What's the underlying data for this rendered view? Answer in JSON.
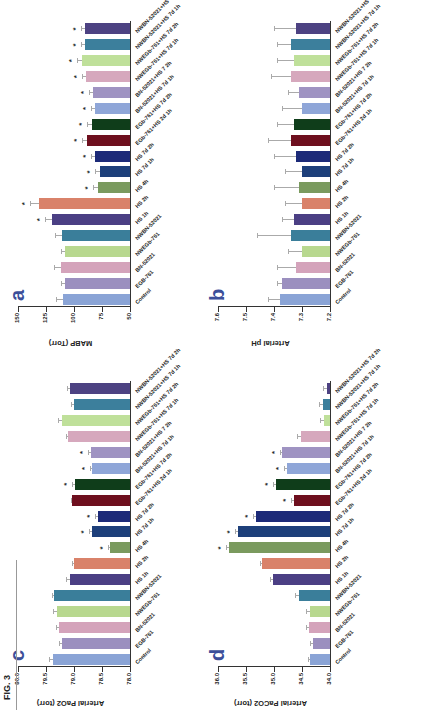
{
  "figure": {
    "label": "FIG. 3"
  },
  "categories": [
    "Control",
    "EGB-761",
    "BN-52021",
    "NWEGb-761",
    "NWBN-52021",
    "HS 1h",
    "HS 2h",
    "HS 4h",
    "HS 7d 1h",
    "HS 7d 2h",
    "EGb-761+HS 2d 1h",
    "EGb-761+HS 7d 2h",
    "BN-52021+HS 7d 1h",
    "BN-52021+HS 7 2h",
    "NWEGb-761+HS 7d 1h",
    "NWEGb-761+HS 7d 2h",
    "NWBN-52021+HS 7d 1h",
    "NWBN-52021+HS 7d 2h"
  ],
  "colors": [
    "#8aa4d6",
    "#9b8fbf",
    "#d4a3bb",
    "#b8d88f",
    "#3a7e9a",
    "#4b3f84",
    "#d9826a",
    "#7a9a5e",
    "#1d3f7a",
    "#1c2a78",
    "#6e0f1e",
    "#0f3d1a",
    "#8fa6d8",
    "#9f93c2",
    "#d6a8bd",
    "#bfe09a",
    "#3c7f9c",
    "#4d4282"
  ],
  "chart_data": [
    {
      "panel": "a",
      "type": "bar",
      "title": "",
      "ylabel": "MABP (Torr)",
      "xlabel": "",
      "ylim": [
        50,
        150
      ],
      "yticks": [
        "150",
        "125",
        "100",
        "75",
        "50"
      ],
      "values": [
        110,
        108,
        112,
        108,
        111,
        120,
        131,
        79,
        77,
        81,
        88,
        84,
        81,
        83,
        89,
        93,
        90,
        90
      ],
      "errors": [
        6,
        4,
        6,
        4,
        6,
        6,
        8,
        4,
        4,
        4,
        5,
        4,
        4,
        4,
        4,
        4,
        4,
        4
      ],
      "significant": [
        false,
        false,
        false,
        false,
        false,
        true,
        true,
        true,
        true,
        true,
        true,
        true,
        true,
        true,
        true,
        true,
        true,
        true
      ]
    },
    {
      "panel": "b",
      "type": "bar",
      "title": "",
      "ylabel": "Arterial pH",
      "xlabel": "",
      "ylim": [
        7.2,
        7.6
      ],
      "yticks": [
        "7.6",
        "7.5",
        "7.4",
        "7.3",
        "7.2"
      ],
      "values": [
        7.38,
        7.37,
        7.32,
        7.3,
        7.34,
        7.33,
        7.3,
        7.31,
        7.3,
        7.32,
        7.34,
        7.33,
        7.3,
        7.31,
        7.34,
        7.33,
        7.34,
        7.32
      ],
      "errors": [
        0.04,
        0.02,
        0.07,
        0.05,
        0.12,
        0.04,
        0.06,
        0.09,
        0.06,
        0.08,
        0.08,
        0.06,
        0.07,
        0.04,
        0.07,
        0.06,
        0.05,
        0.08
      ],
      "significant": [
        false,
        false,
        false,
        false,
        false,
        false,
        false,
        false,
        false,
        false,
        false,
        false,
        false,
        false,
        false,
        false,
        false,
        false
      ]
    },
    {
      "panel": "c",
      "type": "bar",
      "title": "",
      "ylabel": "Arterial PaO2 (torr)",
      "xlabel": "",
      "ylim": [
        78.0,
        80.0
      ],
      "yticks": [
        "80.0",
        "79.5",
        "79.0",
        "78.5",
        "78.0"
      ],
      "values": [
        79.37,
        79.22,
        79.27,
        79.3,
        79.35,
        79.07,
        79.0,
        78.35,
        78.67,
        78.57,
        79.03,
        78.98,
        78.67,
        78.7,
        79.1,
        79.22,
        79.0,
        79.07
      ],
      "errors": [
        0.07,
        0.05,
        0.05,
        0.07,
        0.05,
        0.07,
        0.03,
        0.05,
        0.07,
        0.05,
        0.03,
        0.05,
        0.05,
        0.05,
        0.05,
        0.07,
        0.05,
        0.05
      ],
      "significant": [
        false,
        false,
        false,
        false,
        false,
        false,
        false,
        true,
        true,
        true,
        false,
        true,
        true,
        true,
        false,
        false,
        false,
        false
      ]
    },
    {
      "panel": "d",
      "type": "bar",
      "title": "",
      "ylabel": "Arterial PaCO2 (torr)",
      "xlabel": "",
      "ylim": [
        34.0,
        36.0
      ],
      "yticks": [
        "36.0",
        "35.5",
        "35.0",
        "34.5",
        "34.0"
      ],
      "values": [
        34.35,
        34.3,
        34.37,
        34.35,
        34.55,
        35.02,
        35.22,
        35.8,
        35.65,
        35.32,
        34.65,
        34.97,
        34.77,
        34.85,
        34.52,
        34.1,
        34.12,
        34.05
      ],
      "errors": [
        0.05,
        0.05,
        0.05,
        0.07,
        0.07,
        0.05,
        0.03,
        0.05,
        0.05,
        0.05,
        0.05,
        0.05,
        0.05,
        0.05,
        0.07,
        0.07,
        0.07,
        0.07
      ],
      "significant": [
        false,
        false,
        false,
        false,
        false,
        false,
        false,
        true,
        true,
        true,
        true,
        true,
        true,
        true,
        false,
        false,
        false,
        false
      ]
    }
  ]
}
